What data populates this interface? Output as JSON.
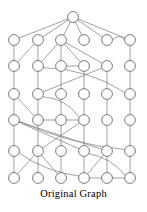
{
  "figure": {
    "caption": "Original Graph",
    "background_color": "#ffffff",
    "node_fill": "#ffffff",
    "node_stroke": "#6b6b6b",
    "edge_color": "#7a7a7a",
    "node_radius": 5.4,
    "node_stroke_width": 0.9,
    "edge_stroke_width": 0.7,
    "width": 147,
    "height": 212
  },
  "chart_data": {
    "type": "diagram",
    "title": "Original Graph",
    "layout": "layered",
    "layer_count": 7,
    "node_count": 37,
    "layers": [
      {
        "index": 0,
        "y": 17,
        "node_x": [
          73
        ]
      },
      {
        "index": 1,
        "y": 40,
        "node_x": [
          14,
          38,
          61,
          84,
          107,
          130
        ]
      },
      {
        "index": 2,
        "y": 66,
        "node_x": [
          14,
          38,
          61,
          84,
          107,
          130
        ]
      },
      {
        "index": 3,
        "y": 94,
        "node_x": [
          14,
          38,
          61,
          84,
          107,
          130
        ]
      },
      {
        "index": 4,
        "y": 120,
        "node_x": [
          14,
          38,
          61,
          84,
          107,
          130
        ]
      },
      {
        "index": 5,
        "y": 151,
        "node_x": [
          14,
          38,
          61,
          84,
          107,
          130
        ]
      },
      {
        "index": 6,
        "y": 178,
        "node_x": [
          14,
          38,
          61,
          84,
          107,
          130
        ]
      }
    ],
    "nodes": [
      {
        "id": "n0-0",
        "layer": 0,
        "col": 0,
        "x": 73,
        "y": 17
      },
      {
        "id": "n1-0",
        "layer": 1,
        "col": 0,
        "x": 14,
        "y": 40
      },
      {
        "id": "n1-1",
        "layer": 1,
        "col": 1,
        "x": 38,
        "y": 40
      },
      {
        "id": "n1-2",
        "layer": 1,
        "col": 2,
        "x": 61,
        "y": 40
      },
      {
        "id": "n1-3",
        "layer": 1,
        "col": 3,
        "x": 84,
        "y": 40
      },
      {
        "id": "n1-4",
        "layer": 1,
        "col": 4,
        "x": 107,
        "y": 40
      },
      {
        "id": "n1-5",
        "layer": 1,
        "col": 5,
        "x": 130,
        "y": 40
      },
      {
        "id": "n2-0",
        "layer": 2,
        "col": 0,
        "x": 14,
        "y": 66
      },
      {
        "id": "n2-1",
        "layer": 2,
        "col": 1,
        "x": 38,
        "y": 66
      },
      {
        "id": "n2-2",
        "layer": 2,
        "col": 2,
        "x": 61,
        "y": 66
      },
      {
        "id": "n2-3",
        "layer": 2,
        "col": 3,
        "x": 84,
        "y": 66
      },
      {
        "id": "n2-4",
        "layer": 2,
        "col": 4,
        "x": 107,
        "y": 66
      },
      {
        "id": "n2-5",
        "layer": 2,
        "col": 5,
        "x": 130,
        "y": 66
      },
      {
        "id": "n3-0",
        "layer": 3,
        "col": 0,
        "x": 14,
        "y": 94
      },
      {
        "id": "n3-1",
        "layer": 3,
        "col": 1,
        "x": 38,
        "y": 94
      },
      {
        "id": "n3-2",
        "layer": 3,
        "col": 2,
        "x": 61,
        "y": 94
      },
      {
        "id": "n3-3",
        "layer": 3,
        "col": 3,
        "x": 84,
        "y": 94
      },
      {
        "id": "n3-4",
        "layer": 3,
        "col": 4,
        "x": 107,
        "y": 94
      },
      {
        "id": "n3-5",
        "layer": 3,
        "col": 5,
        "x": 130,
        "y": 94
      },
      {
        "id": "n4-0",
        "layer": 4,
        "col": 0,
        "x": 14,
        "y": 120
      },
      {
        "id": "n4-1",
        "layer": 4,
        "col": 1,
        "x": 38,
        "y": 120
      },
      {
        "id": "n4-2",
        "layer": 4,
        "col": 2,
        "x": 61,
        "y": 120
      },
      {
        "id": "n4-3",
        "layer": 4,
        "col": 3,
        "x": 84,
        "y": 120
      },
      {
        "id": "n4-4",
        "layer": 4,
        "col": 4,
        "x": 107,
        "y": 120
      },
      {
        "id": "n4-5",
        "layer": 4,
        "col": 5,
        "x": 130,
        "y": 120
      },
      {
        "id": "n5-0",
        "layer": 5,
        "col": 0,
        "x": 14,
        "y": 151
      },
      {
        "id": "n5-1",
        "layer": 5,
        "col": 1,
        "x": 38,
        "y": 151
      },
      {
        "id": "n5-2",
        "layer": 5,
        "col": 2,
        "x": 61,
        "y": 151
      },
      {
        "id": "n5-3",
        "layer": 5,
        "col": 3,
        "x": 84,
        "y": 151
      },
      {
        "id": "n5-4",
        "layer": 5,
        "col": 4,
        "x": 107,
        "y": 151
      },
      {
        "id": "n5-5",
        "layer": 5,
        "col": 5,
        "x": 130,
        "y": 151
      },
      {
        "id": "n6-0",
        "layer": 6,
        "col": 0,
        "x": 14,
        "y": 178
      },
      {
        "id": "n6-1",
        "layer": 6,
        "col": 1,
        "x": 38,
        "y": 178
      },
      {
        "id": "n6-2",
        "layer": 6,
        "col": 2,
        "x": 61,
        "y": 178
      },
      {
        "id": "n6-3",
        "layer": 6,
        "col": 3,
        "x": 84,
        "y": 178
      },
      {
        "id": "n6-4",
        "layer": 6,
        "col": 4,
        "x": 107,
        "y": 178
      },
      {
        "id": "n6-5",
        "layer": 6,
        "col": 5,
        "x": 130,
        "y": 178
      }
    ],
    "edges": [
      {
        "from": "n0-0",
        "to": "n1-0",
        "kind": "straight"
      },
      {
        "from": "n0-0",
        "to": "n1-1",
        "kind": "straight"
      },
      {
        "from": "n0-0",
        "to": "n1-2",
        "kind": "straight"
      },
      {
        "from": "n0-0",
        "to": "n1-3",
        "kind": "straight"
      },
      {
        "from": "n0-0",
        "to": "n1-4",
        "kind": "straight"
      },
      {
        "from": "n0-0",
        "to": "n1-5",
        "kind": "straight"
      },
      {
        "from": "n1-4",
        "to": "n1-5",
        "kind": "curve",
        "bow": -7
      },
      {
        "from": "n1-0",
        "to": "n2-0",
        "kind": "straight"
      },
      {
        "from": "n1-1",
        "to": "n2-1",
        "kind": "straight"
      },
      {
        "from": "n1-1",
        "to": "n2-0",
        "kind": "straight"
      },
      {
        "from": "n1-2",
        "to": "n2-2",
        "kind": "straight"
      },
      {
        "from": "n1-2",
        "to": "n2-1",
        "kind": "straight"
      },
      {
        "from": "n1-2",
        "to": "n2-3",
        "kind": "straight"
      },
      {
        "from": "n1-2",
        "to": "n2-4",
        "kind": "straight"
      },
      {
        "from": "n1-5",
        "to": "n2-5",
        "kind": "straight"
      },
      {
        "from": "n2-2",
        "to": "n2-3",
        "kind": "straight-h"
      },
      {
        "from": "n2-0",
        "to": "n3-0",
        "kind": "straight"
      },
      {
        "from": "n2-1",
        "to": "n3-1",
        "kind": "straight"
      },
      {
        "from": "n2-2",
        "to": "n3-2",
        "kind": "straight"
      },
      {
        "from": "n2-3",
        "to": "n3-3",
        "kind": "straight"
      },
      {
        "from": "n2-4",
        "to": "n3-4",
        "kind": "straight"
      },
      {
        "from": "n2-5",
        "to": "n3-5",
        "kind": "straight"
      },
      {
        "from": "n2-1",
        "to": "n3-5",
        "kind": "curve",
        "bow": -12
      },
      {
        "from": "n2-4",
        "to": "n3-1",
        "kind": "straight"
      },
      {
        "from": "n3-0",
        "to": "n4-0",
        "kind": "straight"
      },
      {
        "from": "n3-1",
        "to": "n4-1",
        "kind": "straight"
      },
      {
        "from": "n3-2",
        "to": "n4-2",
        "kind": "straight"
      },
      {
        "from": "n3-3",
        "to": "n4-3",
        "kind": "straight"
      },
      {
        "from": "n3-4",
        "to": "n4-4",
        "kind": "straight"
      },
      {
        "from": "n3-5",
        "to": "n4-5",
        "kind": "straight"
      },
      {
        "from": "n3-0",
        "to": "n4-1",
        "kind": "straight"
      },
      {
        "from": "n3-1",
        "to": "n4-3",
        "kind": "curve",
        "bow": -10
      },
      {
        "from": "n4-1",
        "to": "n4-2",
        "kind": "straight-h"
      },
      {
        "from": "n4-2",
        "to": "n4-3",
        "kind": "straight-h"
      },
      {
        "from": "n4-0",
        "to": "n5-0",
        "kind": "straight"
      },
      {
        "from": "n4-1",
        "to": "n5-1",
        "kind": "straight"
      },
      {
        "from": "n4-2",
        "to": "n5-2",
        "kind": "straight"
      },
      {
        "from": "n4-3",
        "to": "n5-3",
        "kind": "straight"
      },
      {
        "from": "n4-4",
        "to": "n5-4",
        "kind": "straight"
      },
      {
        "from": "n4-5",
        "to": "n5-5",
        "kind": "straight"
      },
      {
        "from": "n4-0",
        "to": "n5-3",
        "kind": "straight"
      },
      {
        "from": "n4-0",
        "to": "n5-4",
        "kind": "straight"
      },
      {
        "from": "n4-0",
        "to": "n5-5",
        "kind": "curve",
        "bow": 9
      },
      {
        "from": "n4-3",
        "to": "n5-1",
        "kind": "straight"
      },
      {
        "from": "n5-0",
        "to": "n6-0",
        "kind": "straight"
      },
      {
        "from": "n5-1",
        "to": "n6-1",
        "kind": "straight"
      },
      {
        "from": "n5-2",
        "to": "n6-2",
        "kind": "straight"
      },
      {
        "from": "n5-3",
        "to": "n6-3",
        "kind": "straight"
      },
      {
        "from": "n5-4",
        "to": "n6-4",
        "kind": "straight"
      },
      {
        "from": "n5-5",
        "to": "n6-5",
        "kind": "straight"
      },
      {
        "from": "n5-1",
        "to": "n6-0",
        "kind": "straight"
      },
      {
        "from": "n5-1",
        "to": "n6-2",
        "kind": "straight"
      },
      {
        "from": "n5-4",
        "to": "n6-3",
        "kind": "straight"
      },
      {
        "from": "n5-3",
        "to": "n6-5",
        "kind": "curve",
        "bow": -8
      },
      {
        "from": "n5-0",
        "to": "n6-3",
        "kind": "curve",
        "bow": 8
      },
      {
        "from": "n6-3",
        "to": "n6-4",
        "kind": "straight-h"
      },
      {
        "from": "n6-4",
        "to": "n6-5",
        "kind": "straight-h"
      }
    ]
  }
}
